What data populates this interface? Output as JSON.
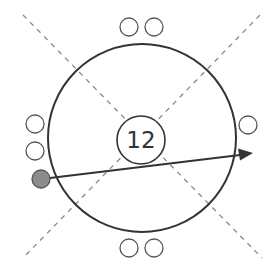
{
  "diagram": {
    "center_label": "12",
    "seats": {
      "top": 2,
      "bottom": 2,
      "left_empty": 2,
      "left_filled": 1,
      "right": 1
    },
    "colors": {
      "outline": "#333333",
      "dashed_guides": "#8a8a8a",
      "filled_seat": "#8c8c8c",
      "background": "#ffffff"
    }
  }
}
